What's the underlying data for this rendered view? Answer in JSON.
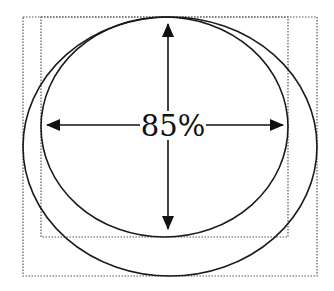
{
  "diagram": {
    "label": "85%",
    "stroke_color": "#1a1a1a",
    "dotted_color": "#555555",
    "inner_box": {
      "x": 41,
      "y": 17,
      "width": 247,
      "height": 220
    },
    "outer_box": {
      "x": 23,
      "y": 17,
      "width": 294,
      "height": 259
    },
    "inner_ellipse": {
      "cx": 164.5,
      "cy": 127,
      "rx": 123.5,
      "ry": 110
    },
    "outer_ellipse": {
      "cx": 170,
      "cy": 146.5,
      "rx": 147,
      "ry": 129.5
    },
    "horizontal_arrow": {
      "y": 125,
      "x_left_tip": 47,
      "x_right_tip": 283
    },
    "vertical_arrow": {
      "x": 168,
      "y_top_tip": 24,
      "y_bottom_tip": 229
    }
  }
}
